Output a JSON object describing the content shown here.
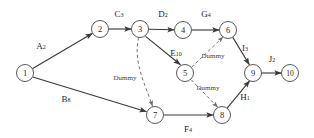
{
  "diagram": {
    "type": "activity-on-arrow-network",
    "background_color": "#ffffff",
    "node_stroke_color": "#585858",
    "edge_color": "#3a3a3a",
    "dummy_edge_color": "#6e6e6e",
    "node_radius": 8.5,
    "nodes": [
      {
        "id": "1",
        "label": "1",
        "x": 25,
        "y": 73
      },
      {
        "id": "2",
        "label": "2",
        "x": 100,
        "y": 29
      },
      {
        "id": "3",
        "label": "3",
        "x": 140,
        "y": 29
      },
      {
        "id": "4",
        "label": "4",
        "x": 183,
        "y": 30
      },
      {
        "id": "5",
        "label": "5",
        "x": 185,
        "y": 73
      },
      {
        "id": "6",
        "label": "6",
        "x": 228,
        "y": 30
      },
      {
        "id": "7",
        "label": "7",
        "x": 155,
        "y": 115
      },
      {
        "id": "8",
        "label": "8",
        "x": 222,
        "y": 115
      },
      {
        "id": "9",
        "label": "9",
        "x": 253,
        "y": 73
      },
      {
        "id": "10",
        "label": "10",
        "x": 290,
        "y": 73
      }
    ],
    "activities": [
      {
        "id": "A",
        "name": "A",
        "duration": "2",
        "from": "1",
        "to": "2",
        "label_x": 41,
        "label_y": 46,
        "style": "solid"
      },
      {
        "id": "B",
        "name": "B",
        "duration": "8",
        "from": "1",
        "to": "7",
        "label_x": 66,
        "label_y": 99,
        "style": "solid"
      },
      {
        "id": "C",
        "name": "C",
        "duration": "3",
        "from": "2",
        "to": "3",
        "label_x": 119,
        "label_y": 14,
        "style": "solid"
      },
      {
        "id": "D",
        "name": "D",
        "duration": "2",
        "from": "3",
        "to": "4",
        "label_x": 163,
        "label_y": 14,
        "style": "solid"
      },
      {
        "id": "G",
        "name": "G",
        "duration": "4",
        "from": "4",
        "to": "6",
        "label_x": 206,
        "label_y": 14,
        "style": "solid"
      },
      {
        "id": "E",
        "name": "E",
        "duration": "10",
        "from": "3",
        "to": "5",
        "label_x": 176,
        "label_y": 53,
        "style": "solid"
      },
      {
        "id": "I",
        "name": "I",
        "duration": "3",
        "from": "6",
        "to": "9",
        "label_x": 245,
        "label_y": 48,
        "style": "solid"
      },
      {
        "id": "J",
        "name": "J",
        "duration": "2",
        "from": "9",
        "to": "10",
        "label_x": 272,
        "label_y": 59,
        "style": "solid"
      },
      {
        "id": "F",
        "name": "F",
        "duration": "4",
        "from": "7",
        "to": "8",
        "label_x": 188,
        "label_y": 129,
        "style": "solid"
      },
      {
        "id": "H",
        "name": "H",
        "duration": "1",
        "from": "8",
        "to": "9",
        "label_x": 245,
        "label_y": 97,
        "style": "solid"
      }
    ],
    "dummy_activities": [
      {
        "id": "dummy-3-7",
        "label": "Dummy",
        "from": "3",
        "to": "7",
        "label_x": 125,
        "label_y": 78,
        "style": "dashed"
      },
      {
        "id": "dummy-5-6",
        "label": "Dummy",
        "from": "5",
        "to": "6",
        "label_x": 213,
        "label_y": 56,
        "style": "dashed"
      },
      {
        "id": "dummy-5-8",
        "label": "Dummy",
        "from": "5",
        "to": "8",
        "label_x": 208,
        "label_y": 88,
        "style": "dashed"
      }
    ]
  }
}
